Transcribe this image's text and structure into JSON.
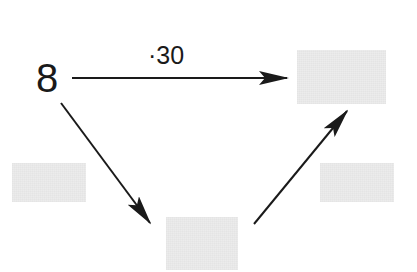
{
  "diagram": {
    "start_value": "8",
    "operation_label": "·30",
    "boxes": [
      {
        "id": "result-top-right",
        "value": ""
      },
      {
        "id": "operator-left",
        "value": ""
      },
      {
        "id": "intermediate-bottom",
        "value": ""
      },
      {
        "id": "operator-right",
        "value": ""
      }
    ],
    "colors": {
      "ink": "#1a1a1a",
      "box_fill": "#ececec",
      "background": "#ffffff"
    }
  }
}
